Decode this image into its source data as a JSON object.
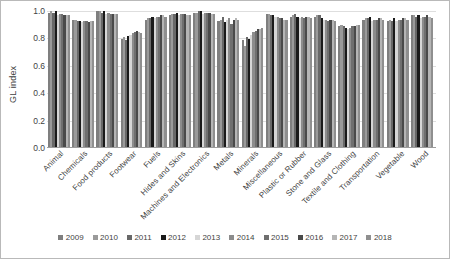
{
  "chart_data": {
    "type": "bar",
    "title": "",
    "xlabel": "",
    "ylabel": "GL index",
    "ylim": [
      0.0,
      1.0
    ],
    "yticks": [
      0.0,
      0.2,
      0.4,
      0.6,
      0.8,
      1.0
    ],
    "ytick_labels": [
      "0.0",
      "0.2",
      "0.4",
      "0.6",
      "0.8",
      "1.0"
    ],
    "grid": true,
    "legend_position": "bottom",
    "categories": [
      "Animal",
      "Chemicals",
      "Food products",
      "Footwear",
      "Fuels",
      "Hides and Skins",
      "Machines and Electronics",
      "Metals",
      "Minerals",
      "Miscellaneous",
      "Plastic or Rubber",
      "Stone and Glass",
      "Textile and Clothing",
      "Transportation",
      "Vegetable",
      "Wood"
    ],
    "series": [
      {
        "name": "2009",
        "color": "#7f7f7f",
        "values": [
          0.98,
          0.93,
          0.99,
          0.79,
          0.93,
          0.96,
          0.98,
          0.92,
          0.78,
          0.97,
          0.95,
          0.95,
          0.88,
          0.93,
          0.92,
          0.96
        ]
      },
      {
        "name": "2010",
        "color": "#9a9a9a",
        "values": [
          0.99,
          0.93,
          0.99,
          0.8,
          0.94,
          0.97,
          0.98,
          0.93,
          0.74,
          0.97,
          0.96,
          0.96,
          0.89,
          0.94,
          0.93,
          0.96
        ]
      },
      {
        "name": "2011",
        "color": "#686868",
        "values": [
          0.98,
          0.92,
          0.98,
          0.78,
          0.94,
          0.97,
          0.99,
          0.95,
          0.8,
          0.96,
          0.97,
          0.96,
          0.88,
          0.94,
          0.92,
          0.95
        ]
      },
      {
        "name": "2012",
        "color": "#1a1a1a",
        "values": [
          0.99,
          0.92,
          0.99,
          0.81,
          0.95,
          0.98,
          0.99,
          0.91,
          0.79,
          0.96,
          0.95,
          0.94,
          0.87,
          0.95,
          0.94,
          0.96
        ]
      },
      {
        "name": "2013",
        "color": "#d6d6d6",
        "values": [
          0.96,
          0.91,
          0.97,
          0.82,
          0.94,
          0.96,
          0.97,
          0.93,
          0.82,
          0.95,
          0.94,
          0.93,
          0.86,
          0.92,
          0.92,
          0.94
        ]
      },
      {
        "name": "2014",
        "color": "#8c8c8c",
        "values": [
          0.97,
          0.92,
          0.98,
          0.83,
          0.95,
          0.97,
          0.98,
          0.94,
          0.84,
          0.95,
          0.95,
          0.93,
          0.87,
          0.93,
          0.93,
          0.95
        ]
      },
      {
        "name": "2015",
        "color": "#6f6f6f",
        "values": [
          0.97,
          0.92,
          0.97,
          0.84,
          0.95,
          0.97,
          0.98,
          0.9,
          0.85,
          0.94,
          0.94,
          0.92,
          0.88,
          0.93,
          0.93,
          0.95
        ]
      },
      {
        "name": "2016",
        "color": "#4a4a4a",
        "values": [
          0.96,
          0.91,
          0.97,
          0.85,
          0.96,
          0.97,
          0.98,
          0.93,
          0.86,
          0.94,
          0.95,
          0.93,
          0.88,
          0.94,
          0.94,
          0.96
        ]
      },
      {
        "name": "2017",
        "color": "#b5b5b5",
        "values": [
          0.96,
          0.92,
          0.97,
          0.84,
          0.96,
          0.96,
          0.97,
          0.94,
          0.86,
          0.93,
          0.95,
          0.93,
          0.89,
          0.94,
          0.94,
          0.95
        ]
      },
      {
        "name": "2018",
        "color": "#8f8f8f",
        "values": [
          0.96,
          0.92,
          0.97,
          0.83,
          0.95,
          0.96,
          0.97,
          0.93,
          0.87,
          0.93,
          0.94,
          0.92,
          0.89,
          0.93,
          0.93,
          0.94
        ]
      }
    ]
  }
}
